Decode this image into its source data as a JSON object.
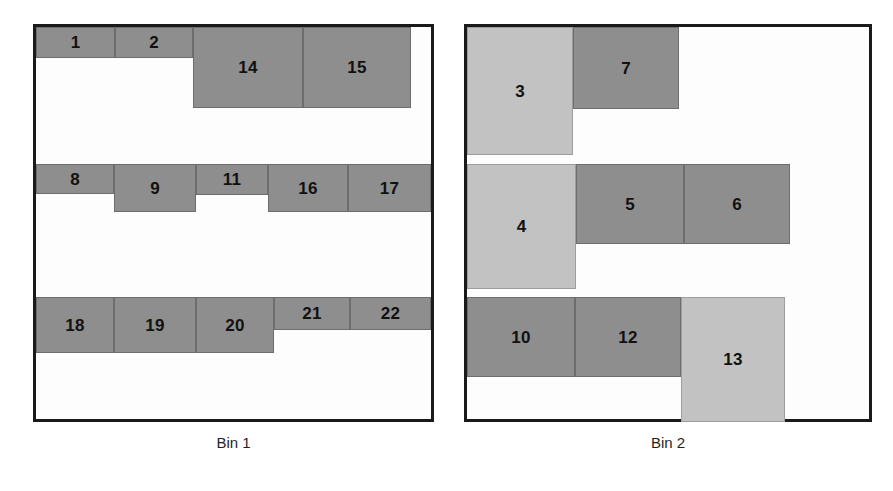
{
  "figure": {
    "type": "bin-packing-shelf-diagram",
    "width": 893,
    "height": 491,
    "background": "#ffffff",
    "palette": {
      "dark_item": "#8e8e8e",
      "light_item": "#c2c2c2",
      "bin_border": "#1a1a1a",
      "item_border": "#6d6d6d",
      "label_text": "#1f1f1f"
    }
  },
  "bins": [
    {
      "id": "bin-1",
      "label": "Bin 1",
      "x": 33,
      "y": 24,
      "width": 401,
      "height": 398,
      "label_x": 33,
      "label_y": 434,
      "label_width": 401,
      "shelves": [
        {
          "id": "bin-1-shelf-1",
          "x": 0,
          "y": 0,
          "width": 395,
          "height": 128,
          "items": [
            {
              "label": "1",
              "x": 0,
              "y": 0,
              "width": 79,
              "height": 31,
              "shade": "light-dark",
              "tone": "dark"
            },
            {
              "label": "2",
              "x": 79,
              "y": 0,
              "width": 78,
              "height": 31,
              "tone": "dark"
            },
            {
              "label": "14",
              "x": 157,
              "y": 0,
              "width": 110,
              "height": 81,
              "tone": "dark"
            },
            {
              "label": "15",
              "x": 267,
              "y": 0,
              "width": 108,
              "height": 81,
              "tone": "dark"
            }
          ]
        },
        {
          "id": "bin-1-shelf-2",
          "x": 0,
          "y": 137,
          "width": 395,
          "height": 125,
          "items": [
            {
              "label": "8",
              "x": 0,
              "y": 0,
              "width": 78,
              "height": 30,
              "tone": "dark"
            },
            {
              "label": "9",
              "x": 78,
              "y": 0,
              "width": 82,
              "height": 48,
              "tone": "dark"
            },
            {
              "label": "11",
              "x": 160,
              "y": 0,
              "width": 72,
              "height": 31,
              "tone": "dark"
            },
            {
              "label": "16",
              "x": 232,
              "y": 0,
              "width": 80,
              "height": 48,
              "tone": "dark"
            },
            {
              "label": "17",
              "x": 312,
              "y": 0,
              "width": 83,
              "height": 48,
              "tone": "dark"
            }
          ]
        },
        {
          "id": "bin-1-shelf-3",
          "x": 0,
          "y": 270,
          "width": 395,
          "height": 125,
          "items": [
            {
              "label": "18",
              "x": 0,
              "y": 0,
              "width": 78,
              "height": 56,
              "tone": "dark"
            },
            {
              "label": "19",
              "x": 78,
              "y": 0,
              "width": 82,
              "height": 56,
              "tone": "dark"
            },
            {
              "label": "20",
              "x": 160,
              "y": 0,
              "width": 78,
              "height": 56,
              "tone": "dark"
            },
            {
              "label": "21",
              "x": 238,
              "y": 0,
              "width": 76,
              "height": 33,
              "tone": "dark"
            },
            {
              "label": "22",
              "x": 314,
              "y": 0,
              "width": 81,
              "height": 33,
              "tone": "dark"
            }
          ]
        }
      ]
    },
    {
      "id": "bin-2",
      "label": "Bin 2",
      "x": 464,
      "y": 24,
      "width": 408,
      "height": 398,
      "label_x": 464,
      "label_y": 434,
      "label_width": 408,
      "shelves": [
        {
          "id": "bin-2-shelf-1",
          "x": 0,
          "y": 0,
          "width": 402,
          "height": 128,
          "items": [
            {
              "label": "3",
              "x": 0,
              "y": 0,
              "width": 106,
              "height": 128,
              "tone": "light"
            },
            {
              "label": "7",
              "x": 106,
              "y": 0,
              "width": 106,
              "height": 82,
              "tone": "dark"
            }
          ]
        },
        {
          "id": "bin-2-shelf-2",
          "x": 0,
          "y": 137,
          "width": 402,
          "height": 125,
          "items": [
            {
              "label": "4",
              "x": 0,
              "y": 0,
              "width": 109,
              "height": 125,
              "tone": "light"
            },
            {
              "label": "5",
              "x": 109,
              "y": 0,
              "width": 108,
              "height": 80,
              "tone": "dark"
            },
            {
              "label": "6",
              "x": 217,
              "y": 0,
              "width": 106,
              "height": 80,
              "tone": "dark"
            }
          ]
        },
        {
          "id": "bin-2-shelf-3",
          "x": 0,
          "y": 270,
          "width": 402,
          "height": 125,
          "items": [
            {
              "label": "10",
              "x": 0,
              "y": 0,
              "width": 108,
              "height": 80,
              "tone": "dark"
            },
            {
              "label": "12",
              "x": 108,
              "y": 0,
              "width": 106,
              "height": 80,
              "tone": "dark"
            },
            {
              "label": "13",
              "x": 214,
              "y": 0,
              "width": 104,
              "height": 125,
              "tone": "light"
            }
          ]
        }
      ]
    }
  ]
}
